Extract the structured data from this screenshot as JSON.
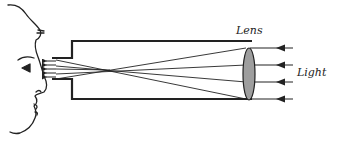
{
  "diagram": {
    "title": "",
    "labels": {
      "lens": "Lens",
      "light": "Light"
    },
    "colors": {
      "stroke": "#222222",
      "lens_fill": "#9e9e9e",
      "background": "#ffffff"
    },
    "components": [
      {
        "id": "observer-face",
        "type": "face-profile"
      },
      {
        "id": "eyepiece",
        "type": "tube-narrow"
      },
      {
        "id": "main-tube",
        "type": "tube-wide"
      },
      {
        "id": "objective-lens",
        "type": "convex-lens",
        "label": "Lens"
      },
      {
        "id": "incoming-light",
        "type": "parallel-rays",
        "count": 4,
        "direction": "right-to-left",
        "label": "Light"
      }
    ]
  }
}
